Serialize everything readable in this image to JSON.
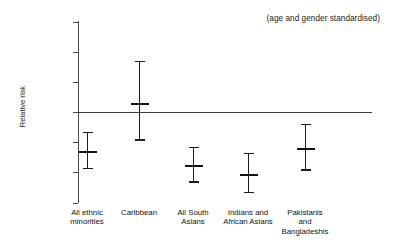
{
  "chart_data": {
    "type": "scatter",
    "title": "",
    "subtitle": "",
    "annotation": "(age and gender standardised)",
    "xlabel": "",
    "ylabel": "Relative risk",
    "ylim": [
      0.4,
      1.6
    ],
    "yticks": [
      {
        "value": 1.6,
        "label": "1.6"
      },
      {
        "value": 1.4,
        "label": "1.4"
      },
      {
        "value": 1.2,
        "label": "1.2"
      },
      {
        "value": 1.0,
        "label": "Whites"
      },
      {
        "value": 0.8,
        "label": "0.8"
      },
      {
        "value": 0.6,
        "label": "0.6"
      },
      {
        "value": 0.4,
        "label": "0.4"
      }
    ],
    "grid": false,
    "legend": "none",
    "reference_line": {
      "value": 1.0,
      "label": "Whites"
    },
    "categories": [
      "All ethnic\nminorities",
      "Caribbean",
      "All South\nAsians",
      "Indians and\nAfrican Asians",
      "Pakistanis\nand\nBangladeshis"
    ],
    "series": [
      {
        "name": "Relative risk",
        "points": [
          {
            "category": "All ethnic minorities",
            "value": 0.74,
            "low": 0.63,
            "high": 0.87
          },
          {
            "category": "Caribbean",
            "value": 1.06,
            "low": 0.82,
            "high": 1.34
          },
          {
            "category": "All South Asians",
            "value": 0.65,
            "low": 0.54,
            "high": 0.77
          },
          {
            "category": "Indians and African Asians",
            "value": 0.59,
            "low": 0.47,
            "high": 0.73
          },
          {
            "category": "Pakistanis and Bangladeshis",
            "value": 0.76,
            "low": 0.62,
            "high": 0.92
          }
        ]
      }
    ],
    "colors": {
      "marker": "#111111",
      "axis": "#4a4a4a",
      "reference_line": "#3c3c3c",
      "background": "#ffffff"
    }
  }
}
